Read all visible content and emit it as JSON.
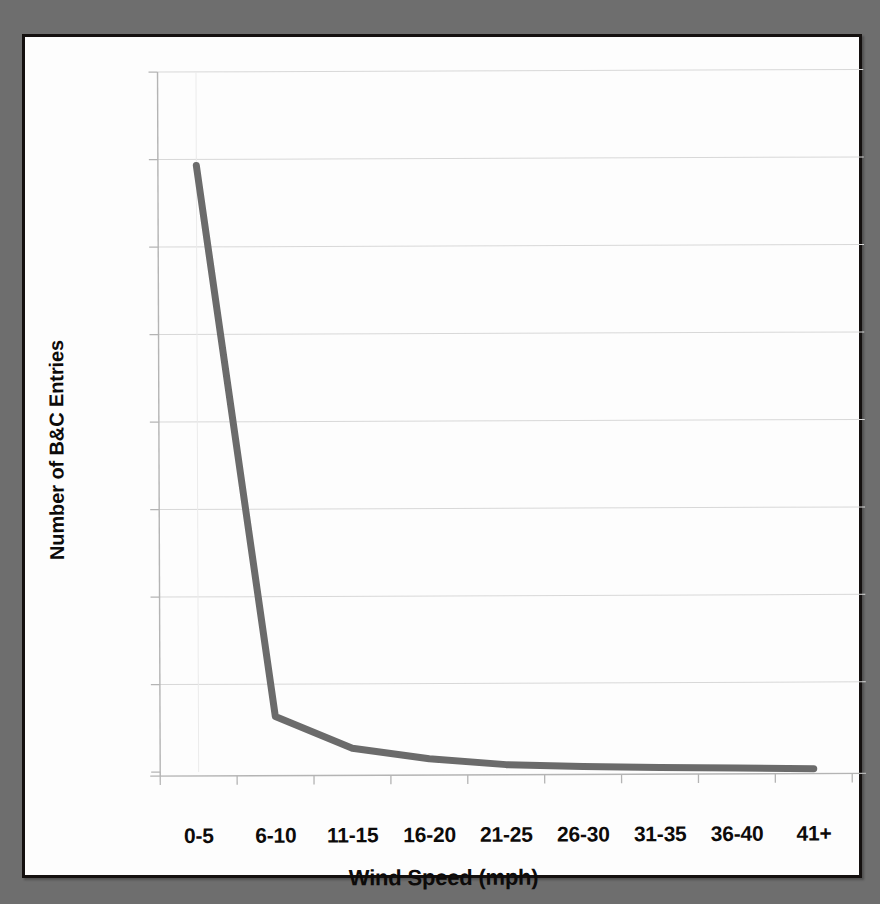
{
  "chart_data": {
    "type": "line",
    "title": "",
    "xlabel": "Wind Speed (mph)",
    "ylabel": "Number of B&C Entries",
    "categories": [
      "0-5",
      "6-10",
      "11-15",
      "16-20",
      "21-25",
      "26-30",
      "31-35",
      "36-40",
      "41+"
    ],
    "values": [
      6930,
      630,
      265,
      140,
      70,
      45,
      30,
      20,
      10
    ],
    "series": [
      {
        "name": "Number of B&C Entries",
        "values": [
          6930,
          630,
          265,
          140,
          70,
          45,
          30,
          20,
          10
        ]
      }
    ],
    "ylim": [
      0,
      8000
    ],
    "ytick_values": [
      0,
      1000,
      2000,
      3000,
      4000,
      5000,
      6000,
      7000,
      8000
    ],
    "ytick_labels": [
      "-",
      "1,000",
      "2,000",
      "3,000",
      "4,000",
      "5,000",
      "6,000",
      "7,000",
      "8,000"
    ],
    "grid": true,
    "legend": false,
    "legend_position": "none",
    "line_color": "#6b6b6b",
    "grid_color": "#d8d8d8",
    "axis_color": "#b4b4b4",
    "background_color": "#fdfdfd",
    "page_border_color": "#14100f",
    "surround_color": "#6e6e6e"
  }
}
